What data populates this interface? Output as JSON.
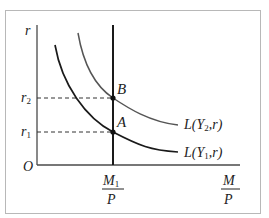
{
  "diagram": {
    "y_axis_label": "r",
    "x_axis_label_num": "M",
    "x_axis_label_den": "P",
    "origin_label": "O",
    "supply_label_num": "M",
    "supply_label_num_sub": "1",
    "supply_label_den": "P",
    "r_levels": [
      {
        "label": "r",
        "sub": "2"
      },
      {
        "label": "r",
        "sub": "1"
      }
    ],
    "points": [
      {
        "label": "B"
      },
      {
        "label": "A"
      }
    ],
    "curves": [
      {
        "label_pre": "L(Y",
        "sub": "2",
        "label_post": ",r)"
      },
      {
        "label_pre": "L(Y",
        "sub": "1",
        "label_post": ",r)"
      }
    ],
    "colors": {
      "curve_y1": "#1a1a1a",
      "curve_y2": "#555555",
      "axis": "#4a4a4a",
      "supply_line": "#1a1a1a",
      "frame": "#b8b8b8"
    }
  }
}
